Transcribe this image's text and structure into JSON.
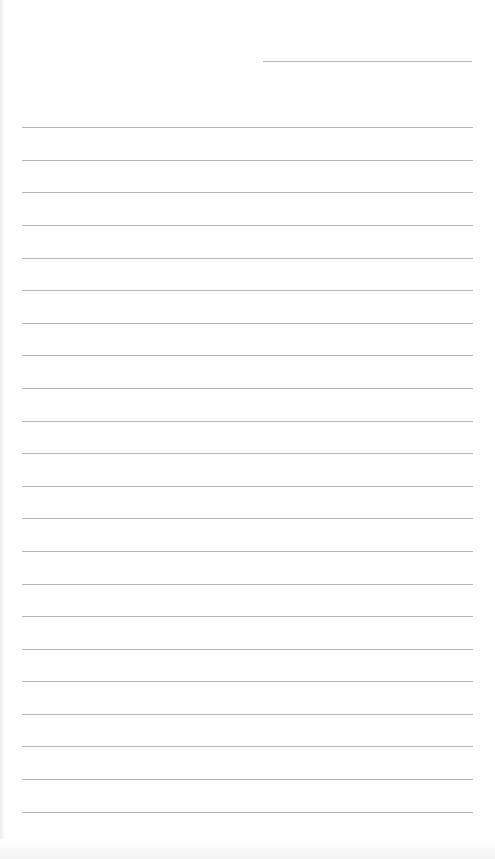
{
  "page": {
    "type": "lined-paper",
    "background_color": "#ffffff",
    "line_color": "#b8b8b8",
    "header_line": {
      "left": 263,
      "top": 61,
      "width": 209
    },
    "ruled_lines": {
      "left": 22,
      "width": 451,
      "tops": [
        127,
        160,
        192,
        225,
        258,
        290,
        323,
        355,
        388,
        421,
        453,
        486,
        518,
        551,
        584,
        616,
        649,
        681,
        714,
        746,
        779,
        812
      ]
    }
  }
}
